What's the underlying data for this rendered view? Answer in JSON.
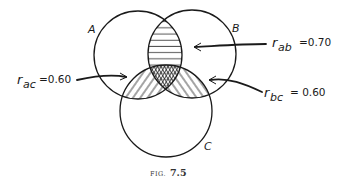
{
  "figure": {
    "caption_prefix": "FIG.",
    "caption_number": "7.5",
    "sets": [
      {
        "id": "A",
        "label": "A",
        "cx": 138,
        "cy": 55,
        "r": 44
      },
      {
        "id": "B",
        "label": "B",
        "cx": 192,
        "cy": 54,
        "r": 44
      },
      {
        "id": "C",
        "label": "C",
        "cx": 166,
        "cy": 111,
        "r": 46
      }
    ],
    "correlations": [
      {
        "id": "ab",
        "symbol": "r",
        "subscript": "ab",
        "value": "=0.70",
        "pattern": "horizontal-lines"
      },
      {
        "id": "ac",
        "symbol": "r",
        "subscript": "ac",
        "value": "=0.60",
        "pattern": "diagonal-lines"
      },
      {
        "id": "bc",
        "symbol": "r",
        "subscript": "bc",
        "value": "= 0.60",
        "pattern": "diagonal-lines"
      }
    ],
    "triple_overlap_pattern": "triangular-grid"
  },
  "colors": {
    "ink": "#1a1a1a",
    "background": "#ffffff",
    "caption": "#333333"
  }
}
